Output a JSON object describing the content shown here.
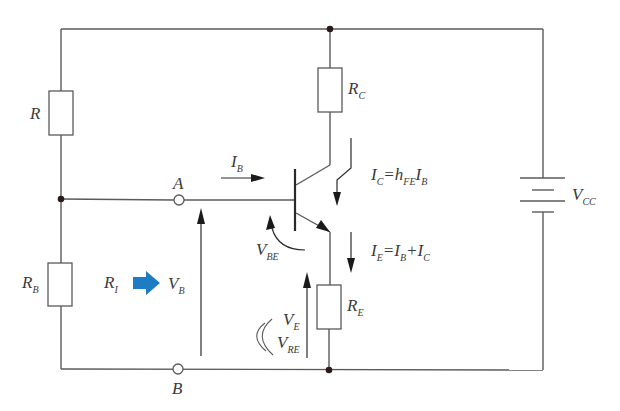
{
  "diagram": {
    "colors": {
      "wire": "#5a5a5a",
      "text": "#3a3a3a",
      "accent_arrow": "#1e7cc4"
    },
    "components": {
      "R": {
        "main": "R",
        "sub": ""
      },
      "RB": {
        "main": "R",
        "sub": "B"
      },
      "RC": {
        "main": "R",
        "sub": "C"
      },
      "RE": {
        "main": "R",
        "sub": "E"
      },
      "VCC": {
        "main": "V",
        "sub": "CC"
      },
      "RI": {
        "main": "R",
        "sub": "I"
      }
    },
    "terminals": {
      "A": "A",
      "B": "B"
    },
    "labels": {
      "IB": {
        "main": "I",
        "sub": "B"
      },
      "VB": {
        "main": "V",
        "sub": "B"
      },
      "VBE": {
        "main": "V",
        "sub": "BE"
      },
      "VE": {
        "main": "V",
        "sub": "E"
      },
      "VRE": {
        "main": "V",
        "sub": "RE"
      }
    },
    "equations": {
      "IC": {
        "lhs_main": "I",
        "lhs_sub": "C",
        "eq": "=",
        "h": "h",
        "h_sub": "FE",
        "rhs_main": "I",
        "rhs_sub": "B"
      },
      "IE": {
        "lhs_main": "I",
        "lhs_sub": "E",
        "eq": "=",
        "t1_main": "I",
        "t1_sub": "B",
        "plus": "+",
        "t2_main": "I",
        "t2_sub": "C"
      }
    },
    "symbols": {
      "equivalence": "((",
      "implies_arrow": "blue-right-arrow"
    }
  }
}
